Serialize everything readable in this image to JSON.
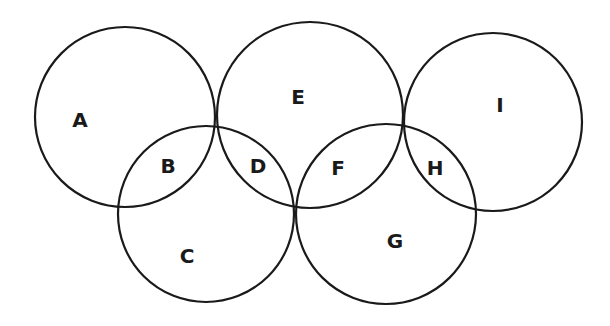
{
  "diagram": {
    "type": "venn-chain",
    "stroke_color": "#1a1a1a",
    "background": "#ffffff",
    "circles": [
      {
        "id": "circle-1",
        "cx": 125,
        "cy": 117,
        "r": 90
      },
      {
        "id": "circle-2",
        "cx": 206,
        "cy": 214,
        "r": 88
      },
      {
        "id": "circle-3",
        "cx": 310,
        "cy": 115,
        "r": 93
      },
      {
        "id": "circle-4",
        "cx": 386,
        "cy": 214,
        "r": 90
      },
      {
        "id": "circle-5",
        "cx": 493,
        "cy": 122,
        "r": 89
      }
    ],
    "regions": [
      {
        "label": "A",
        "x": 80,
        "y": 120
      },
      {
        "label": "B",
        "x": 168,
        "y": 166
      },
      {
        "label": "C",
        "x": 187,
        "y": 256
      },
      {
        "label": "D",
        "x": 258,
        "y": 166
      },
      {
        "label": "E",
        "x": 298,
        "y": 97
      },
      {
        "label": "F",
        "x": 338,
        "y": 168
      },
      {
        "label": "G",
        "x": 395,
        "y": 241
      },
      {
        "label": "H",
        "x": 435,
        "y": 168
      },
      {
        "label": "I",
        "x": 500,
        "y": 105
      }
    ]
  }
}
